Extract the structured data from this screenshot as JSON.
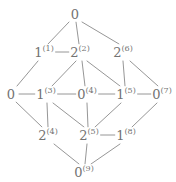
{
  "figure": {
    "type": "hasse-diagram",
    "line_color": "#8a8a8a",
    "text_color": "#737373",
    "background": "#ffffff",
    "width": 176,
    "height": 182
  },
  "nodes": [
    {
      "id": "n0",
      "base": "0",
      "sup": "",
      "x": 75,
      "y": 14
    },
    {
      "id": "n1",
      "base": "1",
      "sup": "(1)",
      "x": 44,
      "y": 52
    },
    {
      "id": "n2",
      "base": "2",
      "sup": "(2)",
      "x": 80,
      "y": 52
    },
    {
      "id": "n6",
      "base": "2",
      "sup": "(6)",
      "x": 123,
      "y": 52
    },
    {
      "id": "nL",
      "base": "0",
      "sup": "",
      "x": 11,
      "y": 94
    },
    {
      "id": "n3",
      "base": "1",
      "sup": "(3)",
      "x": 46,
      "y": 94
    },
    {
      "id": "n4",
      "base": "0",
      "sup": "(4)",
      "x": 87,
      "y": 94
    },
    {
      "id": "n5",
      "base": "1",
      "sup": "(5)",
      "x": 126,
      "y": 94
    },
    {
      "id": "n7",
      "base": "0",
      "sup": "(7)",
      "x": 162,
      "y": 94
    },
    {
      "id": "n4b",
      "base": "2",
      "sup": "(4)",
      "x": 48,
      "y": 135
    },
    {
      "id": "n5b",
      "base": "2",
      "sup": "(5)",
      "x": 89,
      "y": 135
    },
    {
      "id": "n8",
      "base": "1",
      "sup": "(8)",
      "x": 126,
      "y": 135
    },
    {
      "id": "n9",
      "base": "0",
      "sup": "(9)",
      "x": 84,
      "y": 172
    }
  ],
  "edges": [
    {
      "from": "n0",
      "to": "n1",
      "x1": 69,
      "y1": 22,
      "x2": 48,
      "y2": 44
    },
    {
      "from": "n0",
      "to": "n2",
      "x1": 76,
      "y1": 22,
      "x2": 79,
      "y2": 44
    },
    {
      "from": "n0",
      "to": "n6",
      "x1": 82,
      "y1": 22,
      "x2": 119,
      "y2": 44
    },
    {
      "from": "n1",
      "to": "n2",
      "x1": 54,
      "y1": 52,
      "x2": 72,
      "y2": 52
    },
    {
      "from": "n1",
      "to": "nL",
      "x1": 38,
      "y1": 61,
      "x2": 17,
      "y2": 86
    },
    {
      "from": "n2",
      "to": "n3",
      "x1": 76,
      "y1": 61,
      "x2": 52,
      "y2": 86
    },
    {
      "from": "n2",
      "to": "n4",
      "x1": 82,
      "y1": 61,
      "x2": 85,
      "y2": 86
    },
    {
      "from": "n2",
      "to": "n5",
      "x1": 87,
      "y1": 61,
      "x2": 120,
      "y2": 86
    },
    {
      "from": "n6",
      "to": "n5",
      "x1": 123,
      "y1": 61,
      "x2": 125,
      "y2": 86
    },
    {
      "from": "n6",
      "to": "n7",
      "x1": 130,
      "y1": 61,
      "x2": 158,
      "y2": 86
    },
    {
      "from": "nL",
      "to": "n3",
      "x1": 19,
      "y1": 94,
      "x2": 38,
      "y2": 94
    },
    {
      "from": "n3",
      "to": "n4",
      "x1": 56,
      "y1": 94,
      "x2": 79,
      "y2": 94
    },
    {
      "from": "n4",
      "to": "n5",
      "x1": 97,
      "y1": 94,
      "x2": 118,
      "y2": 94
    },
    {
      "from": "n5",
      "to": "n7",
      "x1": 136,
      "y1": 94,
      "x2": 155,
      "y2": 94
    },
    {
      "from": "nL",
      "to": "n4b",
      "x1": 16,
      "y1": 102,
      "x2": 42,
      "y2": 127
    },
    {
      "from": "n3",
      "to": "n4b",
      "x1": 47,
      "y1": 103,
      "x2": 48,
      "y2": 127
    },
    {
      "from": "n3",
      "to": "n5b",
      "x1": 53,
      "y1": 103,
      "x2": 84,
      "y2": 127
    },
    {
      "from": "n4",
      "to": "n5b",
      "x1": 87,
      "y1": 103,
      "x2": 88,
      "y2": 127
    },
    {
      "from": "n5",
      "to": "n5b",
      "x1": 121,
      "y1": 103,
      "x2": 95,
      "y2": 127
    },
    {
      "from": "n7",
      "to": "n8",
      "x1": 157,
      "y1": 103,
      "x2": 132,
      "y2": 127
    },
    {
      "from": "n5b",
      "to": "n8",
      "x1": 97,
      "y1": 135,
      "x2": 119,
      "y2": 135
    },
    {
      "from": "n4b",
      "to": "n9",
      "x1": 54,
      "y1": 144,
      "x2": 79,
      "y2": 164
    },
    {
      "from": "n5b",
      "to": "n9",
      "x1": 87,
      "y1": 144,
      "x2": 85,
      "y2": 164
    },
    {
      "from": "n8",
      "to": "n9",
      "x1": 120,
      "y1": 144,
      "x2": 91,
      "y2": 164
    }
  ]
}
